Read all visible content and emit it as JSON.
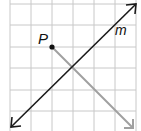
{
  "diagram": {
    "point_label": "P",
    "line_label": "m",
    "colors": {
      "grid": "#c8c8c8",
      "line_m": "#1a1a1a",
      "segment": "#a0a0a0",
      "point": "#111111"
    }
  }
}
